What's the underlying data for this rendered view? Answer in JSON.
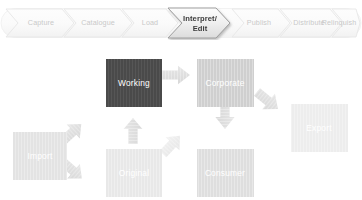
{
  "process_bar": {
    "name": "lifecycle-process-chevrons",
    "active_step": "Interpret/ Edit",
    "steps": [
      {
        "label": "Capture",
        "active": false
      },
      {
        "label": "Catalogue",
        "active": false
      },
      {
        "label": "Load",
        "active": false
      },
      {
        "label": "Interpret/",
        "label2": "Edit",
        "active": true
      },
      {
        "label": "Publish",
        "active": false
      },
      {
        "label": "Distribute",
        "active": false
      },
      {
        "label": "Relinquish",
        "active": false
      }
    ],
    "colors": {
      "inactive_fill": "#fbfbfb",
      "inactive_stroke": "#e8e8e8",
      "inactive_text": "#c9c9c9",
      "active_fill": "#efefef",
      "active_stroke": "#b0b0b0",
      "active_text": "#3b3b3b"
    }
  },
  "diagram": {
    "name": "data-flow-diagram",
    "nodes": [
      {
        "id": "import",
        "label": "Import",
        "fill": "#e3e3e3",
        "text": "#ffffff"
      },
      {
        "id": "working",
        "label": "Working",
        "fill": "#4a4a4a",
        "text": "#ffffff"
      },
      {
        "id": "corporate",
        "label": "Corporate",
        "fill": "#cfcfcf",
        "text": "#ffffff"
      },
      {
        "id": "original",
        "label": "Original",
        "fill": "#e8e8e8",
        "text": "#ffffff"
      },
      {
        "id": "consumer",
        "label": "Consumer",
        "fill": "#dedede",
        "text": "#ffffff"
      },
      {
        "id": "export",
        "label": "Export",
        "fill": "#ededed",
        "text": "#ffffff"
      }
    ],
    "arrows": [
      {
        "id": "import-to-working",
        "from": "import",
        "to": "working",
        "direction": "up-right"
      },
      {
        "id": "import-to-original",
        "from": "import",
        "to": "original",
        "direction": "down-right"
      },
      {
        "id": "working-to-corporate",
        "from": "working",
        "to": "corporate",
        "direction": "right"
      },
      {
        "id": "original-to-working",
        "from": "original",
        "to": "working",
        "direction": "up"
      },
      {
        "id": "original-to-corporate",
        "from": "original",
        "to": "corporate",
        "direction": "up-right"
      },
      {
        "id": "corporate-to-consumer",
        "from": "corporate",
        "to": "consumer",
        "direction": "down"
      },
      {
        "id": "corporate-to-export",
        "from": "corporate",
        "to": "export",
        "direction": "down-right"
      }
    ],
    "colors": {
      "arrow_fill": "#e0e0e0",
      "arrow_fill_light": "#efefef",
      "background": "#ffffff"
    }
  }
}
